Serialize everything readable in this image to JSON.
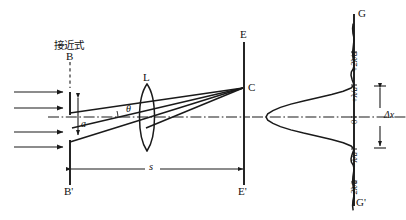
{
  "figure": {
    "kind": "optics-ray-diagram",
    "annotation_cjk": "接近式",
    "ink_color": "#1a1a1a",
    "background_color": "#ffffff"
  },
  "labels": {
    "B_top": "B",
    "B_bottom": "B'",
    "E_top": "E",
    "E_bottom": "E'",
    "C_point": "C",
    "lens": "L",
    "aperture": "a",
    "angle": "θ",
    "distance": "s",
    "G_top": "G",
    "G_bottom": "G'",
    "delta_x": "Δx"
  },
  "pattern_axis": {
    "ticks": [
      {
        "text": "+2λ/a"
      },
      {
        "text": "+λ/a"
      },
      {
        "text": "0"
      },
      {
        "text": "−λ/a"
      },
      {
        "text": "−2λ/a"
      }
    ]
  },
  "chart_data": {
    "type": "line",
    "title": "",
    "xlabel": "",
    "ylabel": "",
    "orientation": "vertical-axis-intensity-to-left",
    "grid": false,
    "legend": null,
    "x_tick_labels": [
      "+2λ/a",
      "+λ/a",
      "0",
      "−λ/a",
      "−2λ/a"
    ],
    "x_tick_positions": [
      2,
      1,
      0,
      -1,
      -2
    ],
    "xlim": [
      -2.9,
      2.9
    ],
    "ylim": [
      0,
      1
    ],
    "series": [
      {
        "name": "single-slit intensity sinc^2(pi u)",
        "x": [
          -2.9,
          -2.75,
          -2.6,
          -2.5,
          -2.4,
          -2.25,
          -2.0,
          -1.85,
          -1.7,
          -1.6,
          -1.5,
          -1.4,
          -1.3,
          -1.15,
          -1.0,
          -0.9,
          -0.8,
          -0.7,
          -0.6,
          -0.5,
          -0.4,
          -0.3,
          -0.2,
          -0.1,
          0.0,
          0.1,
          0.2,
          0.3,
          0.4,
          0.5,
          0.6,
          0.7,
          0.8,
          0.9,
          1.0,
          1.15,
          1.3,
          1.4,
          1.5,
          1.6,
          1.7,
          1.85,
          2.0,
          2.25,
          2.4,
          2.5,
          2.6,
          2.75,
          2.9
        ],
        "y": [
          0.01,
          0.016,
          0.012,
          0.004,
          0.0,
          0.006,
          0.016,
          0.012,
          0.004,
          0.0,
          0.008,
          0.03,
          0.034,
          0.02,
          0.0,
          0.033,
          0.122,
          0.255,
          0.413,
          0.573,
          0.718,
          0.836,
          0.921,
          0.98,
          1.0,
          0.98,
          0.921,
          0.836,
          0.718,
          0.573,
          0.413,
          0.255,
          0.122,
          0.033,
          0.0,
          0.02,
          0.034,
          0.03,
          0.008,
          0.0,
          0.004,
          0.012,
          0.016,
          0.006,
          0.0,
          0.004,
          0.012,
          0.016,
          0.01
        ]
      }
    ],
    "annotations": [
      {
        "text": "Δx",
        "meaning": "central maximum width between first minima"
      },
      {
        "text": "G",
        "meaning": "screen top"
      },
      {
        "text": "G'",
        "meaning": "screen bottom"
      }
    ]
  }
}
